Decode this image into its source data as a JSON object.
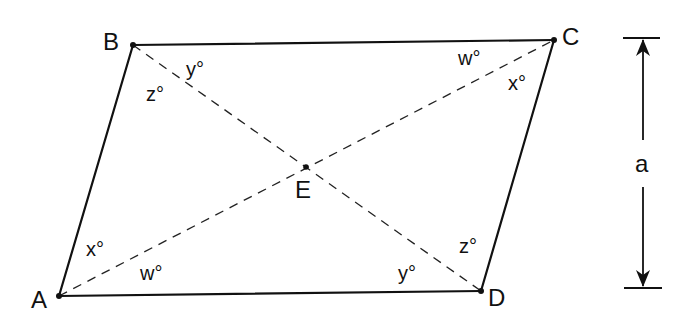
{
  "diagram": {
    "type": "parallelogram-with-diagonals",
    "vertices": {
      "A": {
        "label": "A",
        "x": 59,
        "y": 296
      },
      "B": {
        "label": "B",
        "x": 133,
        "y": 45
      },
      "C": {
        "label": "C",
        "x": 554,
        "y": 40
      },
      "D": {
        "label": "D",
        "x": 481,
        "y": 291
      }
    },
    "intersection": {
      "label": "E",
      "x": 306,
      "y": 167
    },
    "angles": {
      "B_y": "y°",
      "B_z": "z°",
      "C_w": "w°",
      "C_x": "x°",
      "A_x": "x°",
      "A_w": "w°",
      "D_y": "y°",
      "D_z": "z°"
    },
    "height_dimension": {
      "label": "a",
      "x": 643,
      "top": 38,
      "bottom": 288
    },
    "colors": {
      "line": "#111111",
      "background": "#ffffff"
    }
  }
}
